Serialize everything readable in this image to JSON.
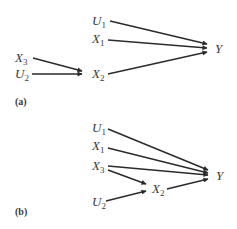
{
  "diagrams": [
    {
      "panel_label": "(a)",
      "nodes": {
        "U1": {
          "base": "U",
          "sub": "1"
        },
        "X1": {
          "base": "X",
          "sub": "1"
        },
        "X3": {
          "base": "X",
          "sub": "3"
        },
        "U2": {
          "base": "U",
          "sub": "2"
        },
        "X2": {
          "base": "X",
          "sub": "2"
        },
        "Y": {
          "base": "Y",
          "sub": ""
        }
      },
      "edges": [
        {
          "from": "U1",
          "to": "Y"
        },
        {
          "from": "X1",
          "to": "Y"
        },
        {
          "from": "X2",
          "to": "Y"
        },
        {
          "from": "X3",
          "to": "X2"
        },
        {
          "from": "U2",
          "to": "X2"
        }
      ]
    },
    {
      "panel_label": "(b)",
      "nodes": {
        "U1": {
          "base": "U",
          "sub": "1"
        },
        "X1": {
          "base": "X",
          "sub": "1"
        },
        "X3": {
          "base": "X",
          "sub": "3"
        },
        "X2": {
          "base": "X",
          "sub": "2"
        },
        "U2": {
          "base": "U",
          "sub": "2"
        },
        "Y": {
          "base": "Y",
          "sub": ""
        }
      },
      "edges": [
        {
          "from": "U1",
          "to": "Y"
        },
        {
          "from": "X1",
          "to": "Y"
        },
        {
          "from": "X3",
          "to": "Y"
        },
        {
          "from": "X3",
          "to": "X2"
        },
        {
          "from": "X2",
          "to": "Y"
        },
        {
          "from": "U2",
          "to": "X2"
        }
      ]
    }
  ]
}
